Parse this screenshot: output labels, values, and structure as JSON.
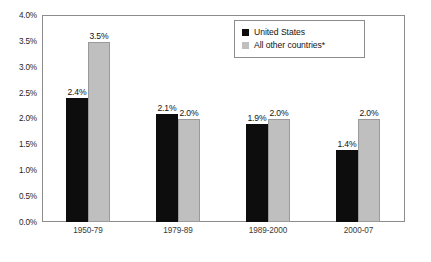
{
  "chart_data": {
    "type": "bar",
    "title": "",
    "subtitle": "",
    "xlabel": "",
    "ylabel": "",
    "categories": [
      "1950-79",
      "1979-89",
      "1989-2000",
      "2000-07"
    ],
    "series": [
      {
        "name": "United States",
        "color": "#0d0d0d",
        "values": [
          2.4,
          2.1,
          1.9,
          1.4
        ],
        "labels": [
          "2.4%",
          "2.1%",
          "1.9%",
          "1.4%"
        ]
      },
      {
        "name": "All other countries*",
        "color": "#bfbfbf",
        "values": [
          3.5,
          2.0,
          2.0,
          2.0
        ],
        "labels": [
          "3.5%",
          "2.0%",
          "2.0%",
          "2.0%"
        ]
      }
    ],
    "ylim": [
      0.0,
      4.0
    ],
    "ytick_values": [
      0.0,
      0.5,
      1.0,
      1.5,
      2.0,
      2.5,
      3.0,
      3.5,
      4.0
    ],
    "ytick_labels": [
      "0.0%",
      "0.5%",
      "1.0%",
      "1.5%",
      "2.0%",
      "2.5%",
      "3.0%",
      "3.5%",
      "4.0%"
    ],
    "grid": false,
    "legend_position": "top-right",
    "legend_entries": [
      "United States",
      "All other countries*"
    ]
  },
  "legend": {
    "items": [
      {
        "label": "United States"
      },
      {
        "label": "All other countries*"
      }
    ]
  }
}
